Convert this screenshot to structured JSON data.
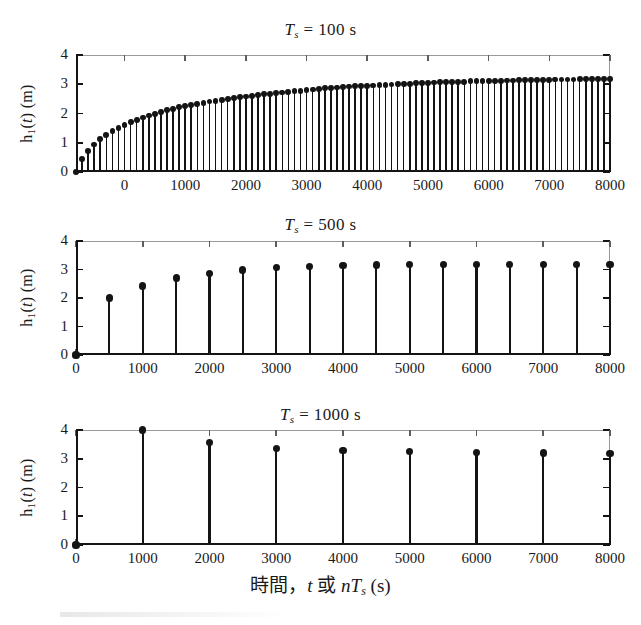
{
  "figure": {
    "xaxis_label_parts": {
      "cjk_time": "時間",
      "comma": "，",
      "t": "t",
      "cjk_or": "或",
      "n": "n",
      "T": "T",
      "sub_s": "s",
      "units": "(s)"
    },
    "ylabel_parts": {
      "h": "h",
      "sub1": "1",
      "t": "(t)",
      "units": "(m)"
    }
  },
  "chart_data": [
    {
      "type": "bar",
      "title": "T_s = 100 s",
      "title_parts": {
        "T": "T",
        "sub": "s",
        "eq": "=",
        "value": "100",
        "unit": "s"
      },
      "xlabel": "",
      "ylabel": "h_1(t) (m)",
      "xlim": [
        -800,
        8000
      ],
      "ylim": [
        0,
        4
      ],
      "yticks": [
        0,
        1,
        2,
        3,
        4
      ],
      "yticklabels": [
        "0",
        "1",
        "2",
        "3",
        "4"
      ],
      "xticks": [
        0,
        1000,
        2000,
        3000,
        4000,
        5000,
        6000,
        7000,
        8000
      ],
      "xticklabels": [
        "0",
        "1000",
        "2000",
        "3000",
        "4000",
        "5000",
        "6000",
        "7000",
        "8000"
      ],
      "grid": false,
      "legend": "none",
      "sample_period": 100,
      "x": [
        -800,
        -700,
        -600,
        -500,
        -400,
        -300,
        -200,
        -100,
        0,
        100,
        200,
        300,
        400,
        500,
        600,
        700,
        800,
        900,
        1000,
        1100,
        1200,
        1300,
        1400,
        1500,
        1600,
        1700,
        1800,
        1900,
        2000,
        2100,
        2200,
        2300,
        2400,
        2500,
        2600,
        2700,
        2800,
        2900,
        3000,
        3100,
        3200,
        3300,
        3400,
        3500,
        3600,
        3700,
        3800,
        3900,
        4000,
        4100,
        4200,
        4300,
        4400,
        4500,
        4600,
        4700,
        4800,
        4900,
        5000,
        5100,
        5200,
        5300,
        5400,
        5500,
        5600,
        5700,
        5800,
        5900,
        6000,
        6100,
        6200,
        6300,
        6400,
        6500,
        6600,
        6700,
        6800,
        6900,
        7000,
        7100,
        7200,
        7300,
        7400,
        7500,
        7600,
        7700,
        7800,
        7900,
        8000
      ],
      "values": [
        0.0,
        0.44,
        0.73,
        0.94,
        1.12,
        1.27,
        1.4,
        1.51,
        1.61,
        1.7,
        1.78,
        1.86,
        1.93,
        1.99,
        2.05,
        2.11,
        2.16,
        2.21,
        2.25,
        2.29,
        2.33,
        2.37,
        2.41,
        2.44,
        2.47,
        2.5,
        2.53,
        2.56,
        2.58,
        2.61,
        2.63,
        2.66,
        2.68,
        2.7,
        2.72,
        2.74,
        2.76,
        2.78,
        2.8,
        2.82,
        2.84,
        2.86,
        2.87,
        2.89,
        2.9,
        2.92,
        2.93,
        2.94,
        2.95,
        2.96,
        2.97,
        2.98,
        2.99,
        3.0,
        3.01,
        3.02,
        3.03,
        3.04,
        3.05,
        3.06,
        3.07,
        3.08,
        3.08,
        3.09,
        3.09,
        3.1,
        3.1,
        3.11,
        3.11,
        3.12,
        3.12,
        3.13,
        3.13,
        3.14,
        3.14,
        3.14,
        3.15,
        3.15,
        3.15,
        3.16,
        3.16,
        3.16,
        3.16,
        3.17,
        3.17,
        3.17,
        3.17,
        3.17,
        3.18,
        3.18,
        3.18
      ]
    },
    {
      "type": "bar",
      "title": "T_s = 500 s",
      "title_parts": {
        "T": "T",
        "sub": "s",
        "eq": "=",
        "value": "500",
        "unit": "s"
      },
      "xlabel": "",
      "ylabel": "h_1(t) (m)",
      "xlim": [
        0,
        8000
      ],
      "ylim": [
        0,
        4
      ],
      "yticks": [
        0,
        1,
        2,
        3,
        4
      ],
      "yticklabels": [
        "0",
        "1",
        "2",
        "3",
        "4"
      ],
      "xticks": [
        0,
        1000,
        2000,
        3000,
        4000,
        5000,
        6000,
        7000,
        8000
      ],
      "xticklabels": [
        "0",
        "1000",
        "2000",
        "3000",
        "4000",
        "5000",
        "6000",
        "7000",
        "8000"
      ],
      "grid": false,
      "legend": "none",
      "sample_period": 500,
      "x": [
        0,
        500,
        1000,
        1500,
        2000,
        2500,
        3000,
        3500,
        4000,
        4500,
        5000,
        5500,
        6000,
        6500,
        7000,
        7500,
        8000
      ],
      "values": [
        0.0,
        2.0,
        2.42,
        2.7,
        2.87,
        2.98,
        3.06,
        3.11,
        3.14,
        3.16,
        3.17,
        3.18,
        3.18,
        3.18,
        3.18,
        3.18,
        3.18
      ]
    },
    {
      "type": "bar",
      "title": "T_s = 1000 s",
      "title_parts": {
        "T": "T",
        "sub": "s",
        "eq": "=",
        "value": "1000",
        "unit": "s"
      },
      "xlabel": "時間，t 或 nT_s (s)",
      "ylabel": "h_1(t) (m)",
      "xlim": [
        0,
        8000
      ],
      "ylim": [
        0,
        4
      ],
      "yticks": [
        0,
        1,
        2,
        3,
        4
      ],
      "yticklabels": [
        "0",
        "1",
        "2",
        "3",
        "4"
      ],
      "xticks": [
        0,
        1000,
        2000,
        3000,
        4000,
        5000,
        6000,
        7000,
        8000
      ],
      "xticklabels": [
        "0",
        "1000",
        "2000",
        "3000",
        "4000",
        "5000",
        "6000",
        "7000",
        "8000"
      ],
      "grid": false,
      "legend": "none",
      "sample_period": 1000,
      "x": [
        0,
        1000,
        2000,
        3000,
        4000,
        5000,
        6000,
        7000,
        8000
      ],
      "values": [
        0.0,
        4.0,
        3.57,
        3.37,
        3.28,
        3.24,
        3.21,
        3.2,
        3.18
      ]
    }
  ]
}
